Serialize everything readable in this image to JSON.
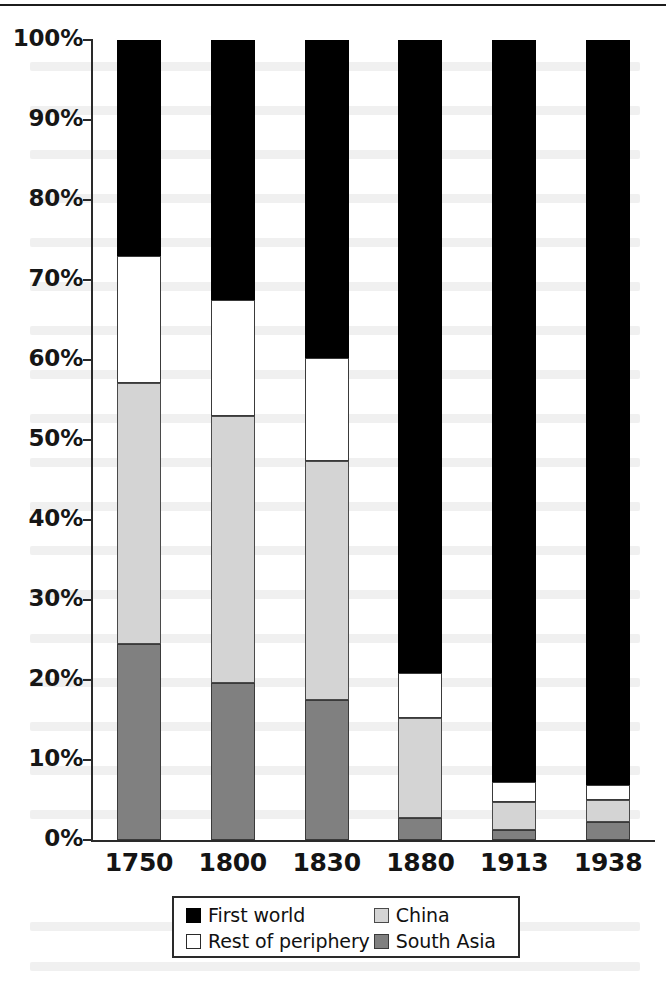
{
  "chart_data": {
    "type": "bar",
    "subtype": "stacked-100-percent",
    "title": "",
    "subtitle": "",
    "xlabel": "",
    "ylabel": "",
    "ylim": [
      0,
      100
    ],
    "grid": false,
    "legend_position": "bottom",
    "categories": [
      "1750",
      "1800",
      "1830",
      "1880",
      "1913",
      "1938"
    ],
    "y_ticks": [
      "0%",
      "10%",
      "20%",
      "30%",
      "40%",
      "50%",
      "60%",
      "70%",
      "80%",
      "90%",
      "100%"
    ],
    "y_tick_values": [
      0,
      10,
      20,
      30,
      40,
      50,
      60,
      70,
      80,
      90,
      100
    ],
    "stack_order_bottom_to_top": [
      "South Asia",
      "China",
      "Rest of periphery",
      "First world"
    ],
    "series": [
      {
        "name": "South Asia",
        "color": "#808080",
        "key": "south-asia",
        "values": [
          24.5,
          19.6,
          17.5,
          2.8,
          1.3,
          2.3
        ]
      },
      {
        "name": "China",
        "color": "#d4d4d4",
        "key": "china",
        "values": [
          32.6,
          33.4,
          29.9,
          12.5,
          3.5,
          2.7
        ]
      },
      {
        "name": "Rest of periphery",
        "color": "#ffffff",
        "key": "rest-of-periphery",
        "values": [
          15.9,
          14.5,
          12.9,
          5.6,
          2.5,
          1.9
        ]
      },
      {
        "name": "First world",
        "color": "#000000",
        "key": "first-world",
        "values": [
          27.0,
          32.5,
          39.7,
          79.1,
          92.7,
          93.1
        ]
      }
    ],
    "cumulative_tops": {
      "south_asia": [
        24.5,
        19.6,
        17.5,
        2.8,
        1.3,
        2.3
      ],
      "china": [
        57.1,
        53.0,
        47.4,
        15.3,
        4.8,
        5.0
      ],
      "rest_of_periphery": [
        73.0,
        67.5,
        60.3,
        20.9,
        7.3,
        6.9
      ],
      "first_world": [
        100,
        100,
        100,
        100,
        100,
        100
      ]
    }
  },
  "legend": {
    "entries": [
      {
        "label": "First world",
        "swatch": "black-filled-square-icon"
      },
      {
        "label": "China",
        "swatch": "light-gray-square-icon"
      },
      {
        "label": "Rest of periphery",
        "swatch": "white-square-icon"
      },
      {
        "label": "South Asia",
        "swatch": "gray-square-icon"
      }
    ]
  }
}
